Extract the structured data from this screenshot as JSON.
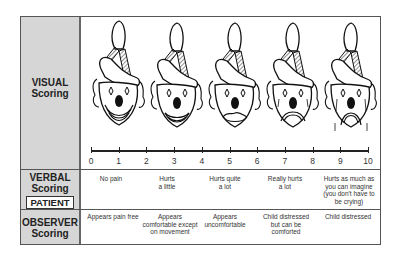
{
  "rows": {
    "visual": {
      "line1": "VISUAL",
      "line2": "Scoring"
    },
    "verbal": {
      "line1": "VERBAL",
      "line2": "Scoring",
      "badge": "PATIENT"
    },
    "observer": {
      "line1": "OBSERVER",
      "line2": "Scoring"
    }
  },
  "faces": [
    {
      "name": "happy-clown",
      "mouth": "big-smile"
    },
    {
      "name": "smiling-clown",
      "mouth": "smile"
    },
    {
      "name": "neutral-sad-clown",
      "mouth": "wavy-frown"
    },
    {
      "name": "sad-clown",
      "mouth": "frown",
      "tears": true
    },
    {
      "name": "crying-clown",
      "mouth": "deep-frown",
      "tears": true
    }
  ],
  "scale": {
    "ticks": [
      "0",
      "1",
      "2",
      "3",
      "4",
      "5",
      "6",
      "7",
      "8",
      "9",
      "10"
    ]
  },
  "verbal": [
    {
      "lines": [
        "No pain"
      ]
    },
    {
      "lines": [
        "Hurts",
        "a little"
      ]
    },
    {
      "lines": [
        "Hurts quite",
        "a lot"
      ]
    },
    {
      "lines": [
        "Really hurts",
        "a lot"
      ]
    },
    {
      "lines": [
        "Hurts as much as",
        "you can imagine",
        "(you don't have to",
        "be crying)"
      ]
    }
  ],
  "observer": [
    {
      "lines": [
        "Appears pain free"
      ]
    },
    {
      "lines": [
        "Appears",
        "comfortable except",
        "on movement"
      ]
    },
    {
      "lines": [
        "Appears",
        "uncomfortable"
      ]
    },
    {
      "lines": [
        "Child distressed",
        "but can be",
        "comforted"
      ]
    },
    {
      "lines": [
        "Child distressed"
      ]
    }
  ],
  "colors": {
    "label_bg": "#d6d6d6",
    "border": "#555555",
    "ink": "#111111"
  }
}
